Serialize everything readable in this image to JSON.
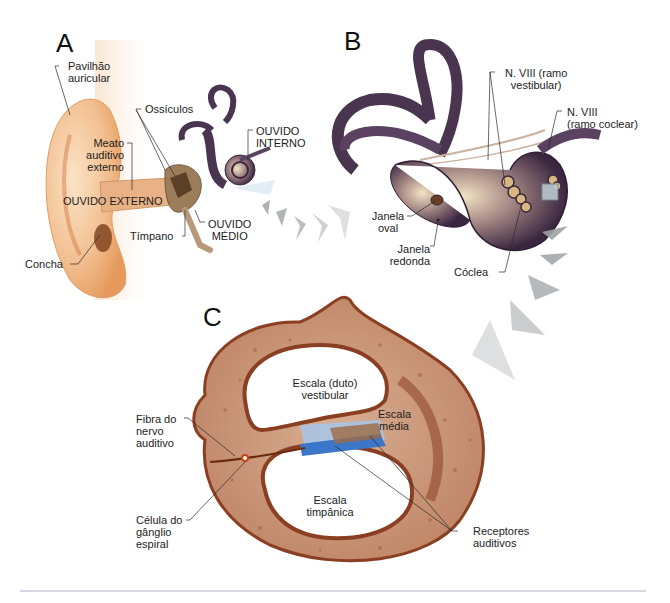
{
  "figure": {
    "panels": [
      {
        "id": "A",
        "letter": "A"
      },
      {
        "id": "B",
        "letter": "B"
      },
      {
        "id": "C",
        "letter": "C"
      }
    ],
    "panel_a": {
      "labels": {
        "pavilhao": [
          "Pavilhão",
          "auricular"
        ],
        "ossiculos": "Ossículos",
        "meato": [
          "Meato",
          "auditivo",
          "externo"
        ],
        "ouvido_interno": [
          "OUVIDO",
          "INTERNO"
        ],
        "ouvido_externo": "OUVIDO EXTERNO",
        "timpano": "Tímpano",
        "ouvido_medio": [
          "OUVIDO",
          "MÉDIO"
        ],
        "concha": "Concha"
      }
    },
    "panel_b": {
      "labels": {
        "n8_vestibular": [
          "N. VIII (ramo",
          "vestibular)"
        ],
        "n8_coclear": [
          "N. VIII",
          "(ramo coclear)"
        ],
        "janela_oval": [
          "Janela",
          "oval"
        ],
        "janela_redonda": [
          "Janela",
          "redonda"
        ],
        "coclea": "Cóclea"
      }
    },
    "panel_c": {
      "labels": {
        "escala_vestibular": [
          "Escala (duto)",
          "vestibular"
        ],
        "escala_media": [
          "Escala",
          "média"
        ],
        "fibra": [
          "Fibra do",
          "nervo",
          "auditivo"
        ],
        "escala_timpanica": [
          "Escala",
          "timpânica"
        ],
        "celula": [
          "Célula do",
          "gânglio",
          "espiral"
        ],
        "receptores": [
          "Receptores",
          "auditivos"
        ]
      }
    },
    "colors": {
      "skin": "#f3c79a",
      "skin_dark": "#d98a4e",
      "bone": "#c9967a",
      "bone_dark": "#8a3f22",
      "labyrinth": "#4a3550",
      "labyrinth_light": "#d9c7a8",
      "membrane_blue": "#3b76c8",
      "membrane_light": "#a9c4e6",
      "arrow_gray": "#9ea3a6",
      "rule": "#aab2c8"
    }
  }
}
